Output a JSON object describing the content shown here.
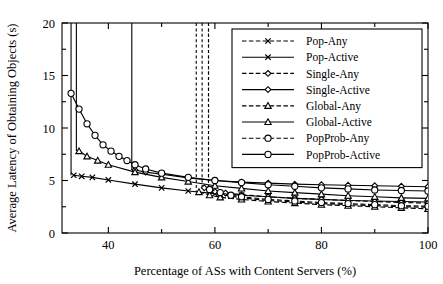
{
  "chart_data": {
    "type": "line",
    "title": "",
    "xlabel": "Percentage of ASs with Content Servers (%)",
    "ylabel": "Average Latency of Obtaining Objects (s)",
    "xlim": [
      31.3,
      100
    ],
    "ylim": [
      0,
      20
    ],
    "xticks": [
      40,
      60,
      80,
      100
    ],
    "xtick_labels": [
      "40",
      "60",
      "80",
      "100"
    ],
    "yticks": [
      0,
      5,
      10,
      15,
      20
    ],
    "ytick_labels": [
      "0",
      "5",
      "10",
      "15",
      "20"
    ],
    "xminor": [
      30,
      50,
      70,
      90
    ],
    "yminor": [
      2.5,
      7.5,
      12.5,
      17.5
    ],
    "grid": false,
    "legend_position": "upper right",
    "series": [
      {
        "name": "Pop-Any",
        "style": "dashed",
        "marker": "x",
        "asymptote": 58.8,
        "asymptote_style": "dashed",
        "x": [
          59,
          61,
          63,
          65,
          70,
          75,
          80,
          85,
          90,
          95,
          100
        ],
        "y": [
          4.0,
          3.7,
          3.5,
          3.35,
          3.1,
          2.95,
          2.8,
          2.7,
          2.6,
          2.5,
          2.45
        ]
      },
      {
        "name": "Pop-Active",
        "style": "solid",
        "marker": "x",
        "asymptote": 33.0,
        "asymptote_style": "solid",
        "x": [
          33.5,
          35,
          37,
          40,
          45,
          50,
          55,
          60,
          65,
          70,
          75,
          80,
          85,
          90,
          95,
          100
        ],
        "y": [
          5.5,
          5.4,
          5.3,
          5.05,
          4.65,
          4.3,
          4.0,
          3.75,
          3.6,
          3.45,
          3.3,
          3.2,
          3.1,
          3.05,
          3.0,
          2.95
        ]
      },
      {
        "name": "Single-Any",
        "style": "dashed",
        "marker": "diamond",
        "asymptote": 57.6,
        "asymptote_style": "dashed",
        "x": [
          58,
          60,
          62,
          65,
          70,
          75,
          80,
          85,
          90,
          95,
          100
        ],
        "y": [
          4.3,
          3.95,
          3.8,
          3.65,
          3.45,
          3.3,
          3.2,
          3.1,
          3.0,
          2.9,
          2.85
        ]
      },
      {
        "name": "Single-Active",
        "style": "solid",
        "marker": "diamond",
        "asymptote": 44.4,
        "asymptote_style": "solid",
        "x": [
          45,
          47,
          50,
          55,
          60,
          65,
          70,
          75,
          80,
          85,
          90,
          95,
          100
        ],
        "y": [
          6.0,
          5.8,
          5.6,
          5.25,
          5.0,
          4.85,
          4.75,
          4.65,
          4.6,
          4.55,
          4.5,
          4.45,
          4.4
        ]
      },
      {
        "name": "Global-Any",
        "style": "dashed",
        "marker": "triangle",
        "asymptote": 56.5,
        "asymptote_style": "dashed",
        "x": [
          57,
          59,
          61,
          65,
          70,
          75,
          80,
          85,
          90,
          95,
          100
        ],
        "y": [
          3.9,
          3.6,
          3.4,
          3.2,
          3.0,
          2.85,
          2.7,
          2.6,
          2.5,
          2.4,
          2.3
        ]
      },
      {
        "name": "Global-Active",
        "style": "solid",
        "marker": "triangle",
        "asymptote": 34.0,
        "asymptote_style": "solid",
        "x": [
          34.5,
          36,
          38,
          40,
          45,
          50,
          55,
          60,
          65,
          70,
          75,
          80,
          85,
          90,
          95,
          100
        ],
        "y": [
          7.8,
          7.3,
          6.9,
          6.5,
          5.8,
          5.3,
          4.9,
          4.5,
          4.25,
          4.0,
          3.85,
          3.7,
          3.55,
          3.45,
          3.35,
          3.3
        ]
      },
      {
        "name": "PopProb-Any",
        "style": "dashed",
        "marker": "circle",
        "asymptote": 58.8,
        "asymptote_style": "dashed",
        "x": [
          59,
          61,
          63,
          65,
          70,
          75,
          80,
          85,
          90,
          95,
          100
        ],
        "y": [
          4.15,
          3.85,
          3.6,
          3.45,
          3.2,
          3.05,
          2.9,
          2.8,
          2.7,
          2.6,
          2.55
        ]
      },
      {
        "name": "PopProb-Active",
        "style": "solid",
        "marker": "circle",
        "x": [
          33.0,
          34.5,
          36.0,
          37.5,
          39.0,
          40.5,
          42.0,
          43.5,
          45.0,
          47,
          50,
          55,
          60,
          65,
          70,
          75,
          80,
          85,
          90,
          95,
          100
        ],
        "y": [
          13.3,
          11.8,
          10.4,
          9.3,
          8.4,
          7.8,
          7.3,
          6.9,
          6.5,
          6.1,
          5.7,
          5.3,
          5.0,
          4.8,
          4.6,
          4.45,
          4.3,
          4.2,
          4.1,
          4.05,
          4.0
        ]
      }
    ]
  },
  "legend": {
    "items": [
      {
        "label": "Pop-Any",
        "style": "dashed",
        "marker": "x"
      },
      {
        "label": "Pop-Active",
        "style": "solid",
        "marker": "x"
      },
      {
        "label": "Single-Any",
        "style": "dashed",
        "marker": "diamond"
      },
      {
        "label": "Single-Active",
        "style": "solid",
        "marker": "diamond"
      },
      {
        "label": "Global-Any",
        "style": "dashed",
        "marker": "triangle"
      },
      {
        "label": "Global-Active",
        "style": "solid",
        "marker": "triangle"
      },
      {
        "label": "PopProb-Any",
        "style": "dashed",
        "marker": "circle"
      },
      {
        "label": "PopProb-Active",
        "style": "solid",
        "marker": "circle"
      }
    ]
  },
  "colors": {
    "ink": "#000000",
    "background": "#ffffff"
  }
}
